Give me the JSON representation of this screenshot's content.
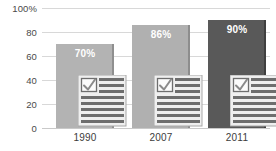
{
  "chart_data": {
    "type": "bar",
    "title": "",
    "subtitle": "",
    "xlabel": "",
    "ylabel": "",
    "categories": [
      "1990",
      "2007",
      "2011"
    ],
    "values": [
      70,
      86,
      90
    ],
    "data_labels": [
      "70%",
      "86%",
      "90%"
    ],
    "ylim": [
      0,
      100
    ],
    "y_ticks": [
      0,
      20,
      40,
      60,
      80,
      100
    ],
    "y_tick_labels": [
      "0",
      "20",
      "40",
      "60",
      "80",
      "100%"
    ],
    "grid": true,
    "legend": false,
    "legend_position": "none",
    "series": [
      {
        "name": "",
        "values": [
          70,
          86,
          90
        ]
      }
    ],
    "bar_colors": [
      "#b3b3b3",
      "#b0b0b0",
      "#595959"
    ],
    "bar_shadow_colors": [
      "#8f8f8f",
      "#8d8d8d",
      "#3f3f3f"
    ],
    "value_label_color": "#ffffff",
    "gridline_color": "#d8d8d8",
    "axis_text_color": "#4a4a4a",
    "background_color": "#ffffff",
    "annotations": [
      {
        "type": "icon",
        "name": "checklist-document-icon",
        "description": "Lined document with a checked checkbox, drawn at the base of each bar",
        "repeat_on": [
          "1990",
          "2007",
          "2011"
        ],
        "paper_color": "#ededed",
        "line_color": "#6e6e6e",
        "check_color": "#8a8a8a"
      }
    ]
  },
  "y_axis": {
    "ticks": [
      {
        "label": "100%",
        "value": 100
      },
      {
        "label": "80",
        "value": 80
      },
      {
        "label": "60",
        "value": 60
      },
      {
        "label": "40",
        "value": 40
      },
      {
        "label": "20",
        "value": 20
      },
      {
        "label": "0",
        "value": 0
      }
    ]
  },
  "x_axis": {
    "ticks": [
      {
        "label": "1990"
      },
      {
        "label": "2007"
      },
      {
        "label": "2011"
      }
    ]
  },
  "bars": [
    {
      "category": "1990",
      "value": 70,
      "label": "70%"
    },
    {
      "category": "2007",
      "value": 86,
      "label": "86%"
    },
    {
      "category": "2011",
      "value": 90,
      "label": "90%"
    }
  ]
}
